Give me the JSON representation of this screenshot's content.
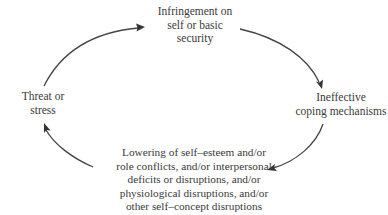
{
  "diagram": {
    "type": "cycle",
    "nodes": [
      {
        "id": "top",
        "text": "Infringement on\nself or basic\nsecurity"
      },
      {
        "id": "right",
        "text": "Ineffective\ncoping mechanisms"
      },
      {
        "id": "bottom",
        "text": "Lowering of self–esteem and/or\nrole conflicts, and/or interpersonal\ndeficits or disruptions, and/or\nphysiological disruptions, and/or\nother self–concept disruptions"
      },
      {
        "id": "left",
        "text": "Threat or\nstress"
      }
    ],
    "edges": [
      {
        "from": "left",
        "to": "top",
        "direction": "clockwise"
      },
      {
        "from": "top",
        "to": "right",
        "direction": "clockwise"
      },
      {
        "from": "right",
        "to": "bottom",
        "direction": "clockwise"
      },
      {
        "from": "bottom",
        "to": "left",
        "direction": "clockwise"
      }
    ],
    "colors": {
      "text": "#3a3a3a",
      "arrow": "#444444",
      "background": "#ffffff"
    }
  }
}
